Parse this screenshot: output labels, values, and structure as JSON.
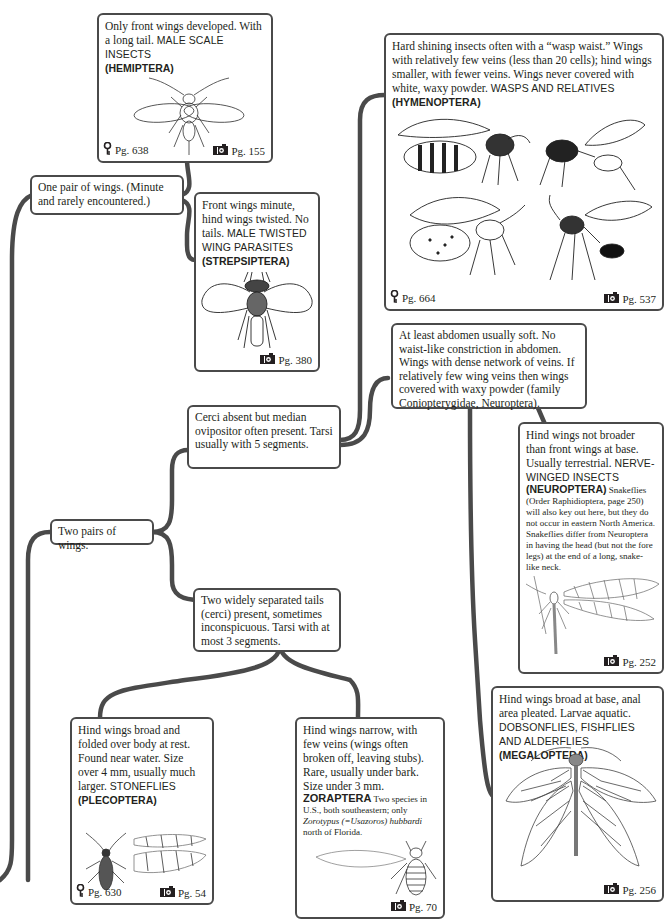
{
  "connector_color": "#4a4a4a",
  "box_border_color": "#4a4a4a",
  "icons": {
    "key": "key-icon",
    "camera": "camera-icon"
  },
  "couplets": {
    "one_pair": {
      "text": "One pair of wings. (Minute and rarely encountered.)"
    },
    "two_pairs": {
      "text": "Two pairs of wings."
    },
    "cerci_absent": {
      "text": "Cerci absent but median ovipositor often present. Tarsi usually with 5 segments."
    },
    "two_tails": {
      "text": "Two widely separated tails (cerci) present, sometimes inconspicuous. Tarsi with at most 3 segments."
    },
    "soft_abdomen": {
      "text": "At least abdomen usually soft. No waist-like constriction in abdomen. Wings with dense network of veins. If relatively few wing veins then wings covered with waxy powder (family Coniopterygidae, Neuroptera)."
    }
  },
  "results": {
    "hemiptera": {
      "description": "Only front wings developed. With a long tail.",
      "common_name": "MALE SCALE INSECTS",
      "order": "(HEMIPTERA)",
      "key_page": "Pg. 638",
      "photo_page": "Pg. 155"
    },
    "strepsiptera": {
      "description": "Front wings minute, hind wings twisted. No tails.",
      "common_name": "MALE TWISTED WING PARASITES",
      "order": "(STREPSIPTERA)",
      "photo_page": "Pg. 380"
    },
    "hymenoptera": {
      "description": "Hard shining insects often with a “wasp waist.” Wings with relatively few veins (less than 20 cells); hind wings smaller, with fewer veins. Wings never covered with white, waxy powder.",
      "common_name": "WASPS AND RELATIVES",
      "order": "(HYMENOPTERA)",
      "key_page": "Pg. 664",
      "photo_page": "Pg. 537"
    },
    "neuroptera": {
      "description": "Hind wings not broader than front wings at base. Usually terrestrial.",
      "common_name": "NERVE-WINGED INSECTS",
      "order": "(NEUROPTERA)",
      "note": "Snakeflies (Order Raphidioptera, page 250) will also key out here, but they do not occur in eastern North America. Snakeflies differ from Neuroptera in having the head (but not the fore legs) at the end of a long, snake-like neck.",
      "photo_page": "Pg. 252"
    },
    "megaloptera": {
      "description": "Hind wings broad at base, anal area pleated. Larvae aquatic.",
      "common_name": "DOBSONFLIES, FISHFLIES AND ALDERFLIES",
      "order": "(MEGALOPTERA)",
      "photo_page": "Pg. 256"
    },
    "plecoptera": {
      "description": "Hind wings broad and folded over body at rest. Found near water. Size over 4 mm, usually much larger.",
      "common_name": "STONEFLIES",
      "order": "(PLECOPTERA)",
      "key_page": "Pg. 630",
      "photo_page": "Pg. 54"
    },
    "zoraptera": {
      "description": "Hind wings narrow, with few veins (wings often broken off, leaving stubs). Rare, usually under bark. Size under 3 mm.",
      "order": "ZORAPTERA",
      "note_pre": "Two species in U.S., both southeastern; only ",
      "note_italic": "Zorotypus (=Usazoros) hubbardi",
      "note_post": " north of Florida.",
      "photo_page": "Pg. 70"
    }
  }
}
